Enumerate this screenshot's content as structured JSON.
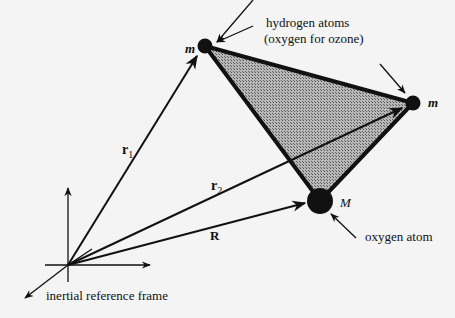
{
  "labels": {
    "hydrogen_line1": "hydrogen atoms",
    "hydrogen_line2": "(oxygen for ozone)",
    "oxygen_atom": "oxygen atom",
    "inertial_frame": "inertial reference frame",
    "mass_top": "m",
    "mass_right": "m",
    "mass_bottom": "M",
    "r1": "r",
    "r1_sub": "1",
    "r2": "r",
    "r2_sub": "2",
    "R": "R"
  },
  "colors": {
    "background": "#f4f4f4",
    "ink": "#111111",
    "triangle_fill": "#9a9a9a"
  }
}
